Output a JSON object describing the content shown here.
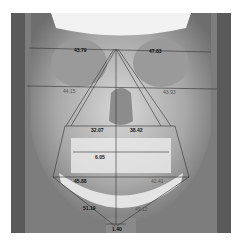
{
  "image": {
    "type": "frontal cephalometric radiograph",
    "measurements": {
      "orbit_left": "43.79",
      "orbit_right": "47.83",
      "zygomatic_left": "44.15",
      "zygomatic_right": "43.93",
      "maxilla_left": "32.07",
      "maxilla_right": "38.42",
      "dental_midline": "6.05",
      "gonial_left": "45.88",
      "gonial_right": "42.41",
      "mandible_left": "51.19",
      "mandible_right": "49.12",
      "menton": "1.40"
    }
  }
}
